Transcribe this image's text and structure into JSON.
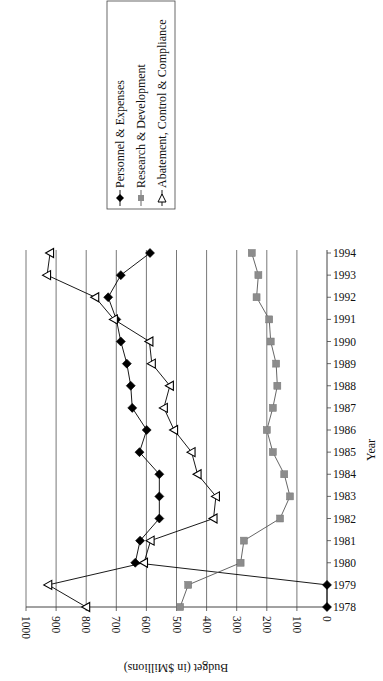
{
  "chart_data": {
    "type": "line",
    "orientation": "rotated-90-ccw",
    "title": "",
    "xlabel": "Year",
    "ylabel": "Budget (in $Millions)",
    "ylim": [
      0,
      1000
    ],
    "yticks": [
      0,
      100,
      200,
      300,
      400,
      500,
      600,
      700,
      800,
      900,
      1000
    ],
    "grid": true,
    "legend_position": "top-right",
    "categories": [
      "1978",
      "1979",
      "1980",
      "1981",
      "1982",
      "1983",
      "1984",
      "1985",
      "1986",
      "1987",
      "1988",
      "1989",
      "1990",
      "1991",
      "1992",
      "1993",
      "1994"
    ],
    "series": [
      {
        "name": "Personnel & Expenses",
        "marker": "diamond-filled",
        "color": "#000000",
        "values": [
          0,
          0,
          637,
          621,
          557,
          557,
          557,
          623,
          599,
          647,
          652,
          665,
          685,
          700,
          727,
          685,
          588
        ]
      },
      {
        "name": "Research & Development",
        "marker": "square-filled",
        "color": "#8c8c8c",
        "values": [
          488,
          461,
          287,
          276,
          156,
          123,
          142,
          180,
          200,
          180,
          165,
          169,
          187,
          192,
          234,
          228,
          250
        ]
      },
      {
        "name": "Abatement, Control & Compliance",
        "marker": "triangle-open",
        "color": "#000000",
        "values": [
          800,
          926,
          608,
          586,
          377,
          369,
          430,
          450,
          508,
          542,
          522,
          582,
          590,
          708,
          770,
          930,
          920
        ]
      }
    ]
  },
  "axis": {
    "value_title": "Budget (in $Millions)",
    "category_title": "Year",
    "value_ticks": [
      "1000",
      "900",
      "800",
      "700",
      "600",
      "500",
      "400",
      "300",
      "200",
      "100",
      "0"
    ],
    "category_ticks": [
      "1978",
      "1979",
      "1980",
      "1981",
      "1982",
      "1983",
      "1984",
      "1985",
      "1986",
      "1987",
      "1988",
      "1989",
      "1990",
      "1991",
      "1992",
      "1993",
      "1994"
    ]
  },
  "legend": {
    "items": [
      {
        "label": "Personnel & Expenses",
        "marker": "diamond-filled"
      },
      {
        "label": "Research & Development",
        "marker": "square-filled"
      },
      {
        "label": "Abatement, Control & Compliance",
        "marker": "triangle-open"
      }
    ]
  }
}
